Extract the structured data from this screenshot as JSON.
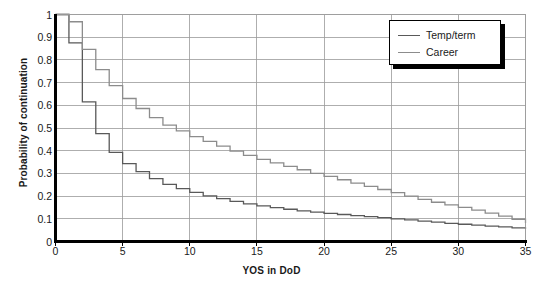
{
  "chart_data": {
    "type": "line",
    "subtype": "step",
    "title": "",
    "xlabel": "YOS in DoD",
    "ylabel": "Probability of continuation",
    "xlim": [
      0,
      35
    ],
    "ylim": [
      0,
      1
    ],
    "grid": true,
    "x_ticks": [
      "0",
      "5",
      "10",
      "15",
      "20",
      "25",
      "30",
      "35"
    ],
    "x_tick_values": [
      0,
      5,
      10,
      15,
      20,
      25,
      30,
      35
    ],
    "y_ticks": [
      "0",
      "0.1",
      "0.2",
      "0.3",
      "0.4",
      "0.5",
      "0.6",
      "0.7",
      "0.8",
      "0.9",
      "1"
    ],
    "y_tick_values": [
      0,
      0.1,
      0.2,
      0.3,
      0.4,
      0.5,
      0.6,
      0.7,
      0.8,
      0.9,
      1
    ],
    "legend_position": "top-right",
    "x": [
      0,
      1,
      2,
      3,
      4,
      5,
      6,
      7,
      8,
      9,
      10,
      11,
      12,
      13,
      14,
      15,
      16,
      17,
      18,
      19,
      20,
      21,
      22,
      23,
      24,
      25,
      26,
      27,
      28,
      29,
      30,
      31,
      32,
      33,
      34,
      35
    ],
    "series": [
      {
        "name": "Temp/term",
        "color": "#595959",
        "values": [
          1.0,
          0.875,
          0.615,
          0.475,
          0.393,
          0.343,
          0.308,
          0.277,
          0.252,
          0.233,
          0.216,
          0.201,
          0.189,
          0.177,
          0.166,
          0.157,
          0.149,
          0.142,
          0.135,
          0.129,
          0.124,
          0.119,
          0.114,
          0.11,
          0.105,
          0.1,
          0.095,
          0.09,
          0.085,
          0.08,
          0.076,
          0.072,
          0.068,
          0.064,
          0.06,
          0.056
        ]
      },
      {
        "name": "Career",
        "color": "#8c8c8c",
        "values": [
          1.0,
          0.968,
          0.846,
          0.757,
          0.687,
          0.63,
          0.586,
          0.546,
          0.513,
          0.487,
          0.462,
          0.441,
          0.42,
          0.398,
          0.379,
          0.362,
          0.346,
          0.331,
          0.316,
          0.3,
          0.287,
          0.272,
          0.257,
          0.243,
          0.229,
          0.215,
          0.2,
          0.186,
          0.173,
          0.161,
          0.15,
          0.138,
          0.125,
          0.112,
          0.098,
          0.082
        ]
      }
    ]
  },
  "legend": {
    "items": [
      {
        "label": "Temp/term"
      },
      {
        "label": "Career"
      }
    ]
  }
}
